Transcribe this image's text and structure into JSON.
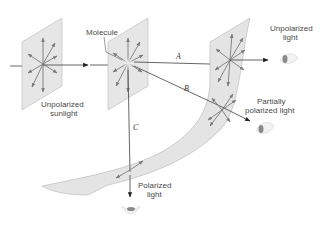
{
  "diagram": {
    "labels": {
      "molecule": "Molecule",
      "unpolarized_sunlight_line1": "Unpolarized",
      "unpolarized_sunlight_line2": "sunlight",
      "unpolarized_light_line1": "Unpolarized",
      "unpolarized_light_line2": "light",
      "partially_polarized_line1": "Partially",
      "partially_polarized_line2": "polarized light",
      "polarized_light_line1": "Polarized",
      "polarized_light_line2": "light"
    },
    "paths": {
      "a": "A",
      "b": "B",
      "c": "C"
    },
    "icons": [
      "arrow-icon",
      "eye-icon"
    ],
    "colors": {
      "panel": "#e6e6e6",
      "vector": "#7a7a7a",
      "ray": "#555555",
      "text": "#4a4a4a"
    }
  }
}
